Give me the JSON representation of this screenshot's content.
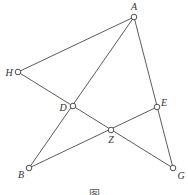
{
  "diagram": {
    "points": [
      {
        "id": "A",
        "label": "A",
        "x": 134,
        "y": 17,
        "lx": 134,
        "ly": 9
      },
      {
        "id": "H",
        "label": "H",
        "x": 18,
        "y": 72,
        "lx": 8,
        "ly": 75
      },
      {
        "id": "D",
        "label": "D",
        "x": 73,
        "y": 106,
        "lx": 62,
        "ly": 110
      },
      {
        "id": "E",
        "label": "E",
        "x": 157,
        "y": 107,
        "lx": 163,
        "ly": 106
      },
      {
        "id": "Z",
        "label": "Z",
        "x": 111,
        "y": 130,
        "lx": 111,
        "ly": 143
      },
      {
        "id": "B",
        "label": "B",
        "x": 29,
        "y": 168,
        "lx": 21,
        "ly": 177
      },
      {
        "id": "G",
        "label": "G",
        "x": 173,
        "y": 168,
        "lx": 180,
        "ly": 178
      }
    ],
    "edges": [
      [
        "H",
        "A"
      ],
      [
        "A",
        "B"
      ],
      [
        "A",
        "G"
      ],
      [
        "H",
        "G"
      ],
      [
        "B",
        "E"
      ]
    ],
    "caption": "图"
  }
}
